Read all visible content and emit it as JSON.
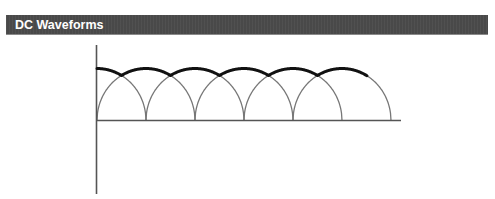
{
  "header": {
    "title": "DC Waveforms"
  },
  "diagram": {
    "type": "rectified-waveform",
    "axes": {
      "origin_x": 96.5,
      "baseline_y": 120.5,
      "y_axis_top": 45,
      "y_axis_bottom": 194,
      "x_axis_right": 401,
      "color": "#555555",
      "width": 1.6
    },
    "arches": {
      "half_width": 49,
      "amplitude": 52,
      "color": "#777777",
      "width": 1.3,
      "set_a_peaks": [
        97,
        195,
        293
      ],
      "set_b_peaks": [
        146,
        244,
        342
      ],
      "clip_left": 96.5
    },
    "envelope": {
      "color": "#111111",
      "width": 3,
      "x_start": 97,
      "x_end": 367
    }
  }
}
